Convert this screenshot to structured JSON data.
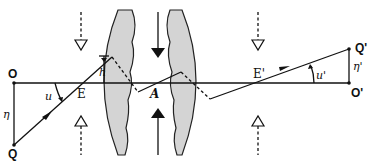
{
  "figure": {
    "type": "optical-ray-diagram",
    "colors": {
      "lens_fill": "#d4d4d4",
      "ink": "#111111",
      "background": "#ffffff"
    }
  },
  "labels": {
    "object_axis_point": "O",
    "object_point": "Q",
    "object_height": "η",
    "object_angle": "u",
    "entrance_pupil": "E",
    "pupil_height": "h",
    "stop": "A",
    "exit_pupil": "E'",
    "image_angle": "u'",
    "image_height": "η'",
    "image_axis_point": "O'",
    "image_point": "Q'"
  },
  "elements": {
    "optical_axis": "horizontal line from O to O'",
    "lens_left": "gray biconvex-side lens element (left)",
    "lens_right": "gray biconvex-side lens element (right)",
    "aperture_arrows": [
      "solid arrow down (top)",
      "solid arrow up (bottom)"
    ],
    "pupil_arrows": [
      "dashed hollow arrow down at E",
      "dashed hollow arrow up at E",
      "dashed hollow arrow down at E'",
      "dashed hollow arrow up at E'"
    ]
  }
}
